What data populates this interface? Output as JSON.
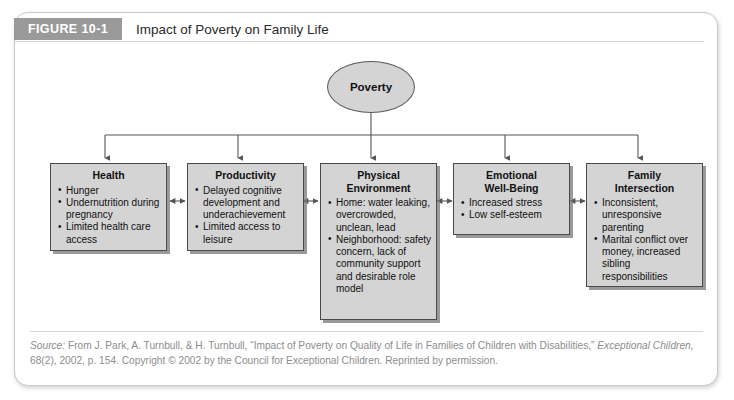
{
  "figure": {
    "tag": "FIGURE 10-1",
    "title": "Impact of Poverty on Family Life"
  },
  "colors": {
    "tag_band": "#9a9a9a",
    "node_fill": "#d4d4d4",
    "node_border": "#4a4a4a",
    "connector": "#555555",
    "caption_text": "#8d8d8d",
    "frame_border": "#c9c9c9"
  },
  "diagram": {
    "type": "flowchart",
    "root": {
      "label": "Poverty",
      "shape": "ellipse"
    },
    "nodes": [
      {
        "id": "health",
        "title": "Health",
        "items": [
          "Hunger",
          "Undernutrition during pregnancy",
          "Limited health care access"
        ]
      },
      {
        "id": "productivity",
        "title": "Productivity",
        "items": [
          "Delayed cognitive development and underachievement",
          "Limited access to leisure"
        ]
      },
      {
        "id": "physical-environment",
        "title_line1": "Physical",
        "title_line2": "Environment",
        "items": [
          "Home: water leaking, overcrowded, unclean, lead",
          "Neighborhood: safety concern, lack of community support and desirable role model"
        ]
      },
      {
        "id": "emotional-well-being",
        "title_line1": "Emotional",
        "title_line2": "Well-Being",
        "items": [
          "Increased stress",
          "Low self-esteem"
        ]
      },
      {
        "id": "family-intersection",
        "title_line1": "Family",
        "title_line2": "Intersection",
        "items": [
          "Inconsistent, unresponsive parenting",
          "Marital conflict over money, increased sibling responsibilities"
        ]
      }
    ]
  },
  "caption": {
    "label": "Source:",
    "line1_a": " From J. Park, A. Turnbull, & H. Turnbull, “Impact of Poverty on Quality of Life in Families of Children with Disabilities,” ",
    "journal": "Exceptional Children,",
    "line2": "68(2), 2002, p. 154. Copyright © 2002 by the Council for Exceptional Children. Reprinted by permission."
  }
}
